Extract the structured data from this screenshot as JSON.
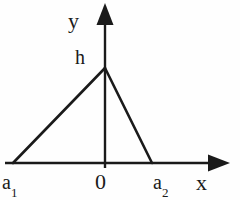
{
  "figure": {
    "background_color": "#fefefe",
    "stroke_color": "#1a1a1a",
    "labels": {
      "y_axis": "y",
      "x_axis": "x",
      "origin": "0",
      "height": "h",
      "left_root_base": "a",
      "left_root_sub": "1",
      "right_root_base": "a",
      "right_root_sub": "2"
    },
    "geometry": {
      "origin": {
        "x": 105,
        "y": 163
      },
      "apex": {
        "x": 105,
        "y": 68
      },
      "left_vertex": {
        "x": 13,
        "y": 163
      },
      "right_vertex": {
        "x": 152,
        "y": 163
      },
      "x_axis_start": {
        "x": 5,
        "y": 163
      },
      "x_axis_tip": {
        "x": 230,
        "y": 163
      },
      "y_axis_base": {
        "x": 105,
        "y": 168
      },
      "y_axis_tip": {
        "x": 105,
        "y": 3
      },
      "axis_stroke_width": 2.4,
      "triangle_stroke_width": 2.6,
      "arrow_head_length": 17,
      "arrow_head_halfwidth": 8
    }
  }
}
